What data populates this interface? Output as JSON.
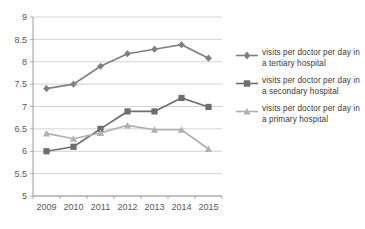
{
  "chart_data": {
    "type": "line",
    "title": "",
    "xlabel": "",
    "ylabel": "",
    "categories": [
      "2009",
      "2010",
      "2011",
      "2012",
      "2013",
      "2014",
      "2015"
    ],
    "ylim": [
      5,
      9
    ],
    "ytick_step": 0.5,
    "yticks": [
      "5",
      "5.5",
      "6",
      "6.5",
      "7",
      "7.5",
      "8",
      "8.5",
      "9"
    ],
    "grid": true,
    "legend_position": "right",
    "series": [
      {
        "name": "visits per doctor per day in a tertiary hospital",
        "values": [
          7.4,
          7.5,
          7.9,
          8.18,
          8.28,
          8.38,
          8.08
        ],
        "color": "#808080",
        "marker": "diamond"
      },
      {
        "name": "visits per doctor per day in a secondary hospital",
        "values": [
          6.0,
          6.1,
          6.5,
          6.89,
          6.89,
          7.19,
          6.99
        ],
        "color": "#6e6e6e",
        "marker": "square"
      },
      {
        "name": "visits per doctor per day in a primary hospital",
        "values": [
          6.4,
          6.28,
          6.41,
          6.58,
          6.48,
          6.48,
          6.05
        ],
        "color": "#b0b0b0",
        "marker": "triangle"
      }
    ]
  },
  "axis": {
    "line_color": "#9a9a9a",
    "grid_color": "#c8c8c8",
    "tick_text_color": "#595959",
    "tick_font_size": 9
  },
  "legend": {
    "items": [
      {
        "label": "visits per doctor per day in a tertiary hospital",
        "icon": "diamond-marker-icon"
      },
      {
        "label": "visits per doctor per day in a secondary hospital",
        "icon": "square-marker-icon"
      },
      {
        "label": "visits per doctor per day in a primary hospital",
        "icon": "triangle-marker-icon"
      }
    ]
  }
}
